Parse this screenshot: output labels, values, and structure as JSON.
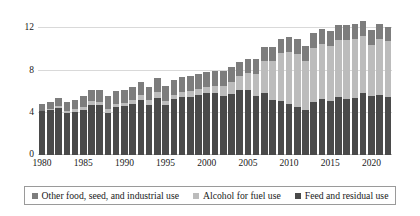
{
  "chart_data": {
    "type": "bar",
    "subtype": "stacked-bar",
    "title": "",
    "xlabel": "",
    "ylabel": "",
    "ylim": [
      0,
      12.8
    ],
    "yticks": [
      0,
      4,
      8,
      12
    ],
    "ytick_labels": [
      "0",
      "4",
      "8",
      "12"
    ],
    "grid": true,
    "legend_position": "bottom",
    "x": [
      1980,
      1981,
      1982,
      1983,
      1984,
      1985,
      1986,
      1987,
      1988,
      1989,
      1990,
      1991,
      1992,
      1993,
      1994,
      1995,
      1996,
      1997,
      1998,
      1999,
      2000,
      2001,
      2002,
      2003,
      2004,
      2005,
      2006,
      2007,
      2008,
      2009,
      2010,
      2011,
      2012,
      2013,
      2014,
      2015,
      2016,
      2017,
      2018,
      2019,
      2020,
      2021,
      2022
    ],
    "xtick_labels": [
      "1980",
      "1985",
      "1990",
      "1995",
      "2000",
      "2005",
      "2010",
      "2015",
      "2020"
    ],
    "xticks": [
      1980,
      1985,
      1990,
      1995,
      2000,
      2005,
      2010,
      2015,
      2020
    ],
    "series": [
      {
        "name": "Feed and residual use",
        "color": "#4a4a4a",
        "values": [
          4.13,
          4.24,
          4.48,
          3.98,
          4.1,
          4.29,
          4.78,
          4.71,
          4.03,
          4.52,
          4.61,
          4.79,
          5.25,
          4.71,
          5.43,
          4.7,
          5.28,
          5.48,
          5.5,
          5.66,
          5.84,
          5.87,
          5.56,
          5.8,
          6.16,
          6.15,
          5.6,
          5.86,
          5.18,
          5.13,
          4.79,
          4.54,
          4.31,
          5.04,
          5.31,
          5.11,
          5.47,
          5.3,
          5.43,
          5.9,
          5.6,
          5.7,
          5.54
        ]
      },
      {
        "name": "Alcohol for fuel use",
        "color": "#bcbcbc",
        "values": [
          0.04,
          0.09,
          0.14,
          0.16,
          0.23,
          0.28,
          0.3,
          0.32,
          0.34,
          0.35,
          0.35,
          0.4,
          0.43,
          0.46,
          0.53,
          0.4,
          0.43,
          0.48,
          0.53,
          0.57,
          0.63,
          0.71,
          0.99,
          1.17,
          1.32,
          1.6,
          2.12,
          3.03,
          3.71,
          4.57,
          5.02,
          5.01,
          4.65,
          5.13,
          5.2,
          5.21,
          5.43,
          5.61,
          5.6,
          5.38,
          4.85,
          5.32,
          5.23
        ]
      },
      {
        "name": "Other food, seed, and industrial use",
        "color": "#7d7d7d",
        "values": [
          0.7,
          0.74,
          0.8,
          0.85,
          0.93,
          1.0,
          1.07,
          1.11,
          1.18,
          1.24,
          1.23,
          1.26,
          1.29,
          1.32,
          1.37,
          1.4,
          1.38,
          1.4,
          1.43,
          1.44,
          1.4,
          1.39,
          1.37,
          1.37,
          1.36,
          1.37,
          1.36,
          1.34,
          1.32,
          1.31,
          1.41,
          1.43,
          1.4,
          1.37,
          1.4,
          1.42,
          1.45,
          1.45,
          1.43,
          1.43,
          1.42,
          1.42,
          1.4
        ]
      }
    ]
  },
  "legend": {
    "items": [
      {
        "label": "Other food, seed, and industrial use",
        "key": "other"
      },
      {
        "label": "Alcohol for fuel use",
        "key": "fuel"
      },
      {
        "label": "Feed and residual use",
        "key": "feed"
      }
    ]
  }
}
